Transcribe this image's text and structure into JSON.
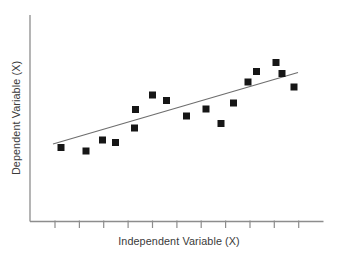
{
  "chart_data": {
    "type": "scatter",
    "title": "",
    "xlabel": "Independent Variable (X)",
    "ylabel": "Dependent Variable (X)",
    "legend": false,
    "grid": false,
    "coords": "screen pixels on 337x258 canvas, y increases downward",
    "plot_area": {
      "y_axis_x": 30,
      "y_axis_top": 15,
      "x_axis_y": 221.5,
      "x_axis_end": 323.5
    },
    "x_ticks": {
      "labels_shown": false,
      "tick_length": 6.5,
      "positions": [
        55,
        79.4,
        103.7,
        128.1,
        152.5,
        176.9,
        201.2,
        225.6,
        250.0,
        274.3,
        298.7
      ]
    },
    "y_ticks": {
      "labels_shown": false,
      "positions": []
    },
    "marker": {
      "shape": "square",
      "size": 7,
      "color": "#161616"
    },
    "trend_line": {
      "x1": 53,
      "y1": 144,
      "x2": 298,
      "y2": 72.5,
      "color": "#6e6e6e",
      "width": 1.2
    },
    "points": [
      [
        61,
        147.5
      ],
      [
        86,
        151
      ],
      [
        102.5,
        140
      ],
      [
        115.5,
        142.5
      ],
      [
        134.5,
        128
      ],
      [
        135.5,
        109.5
      ],
      [
        152.5,
        95
      ],
      [
        166.5,
        100.5
      ],
      [
        186.5,
        116
      ],
      [
        206,
        109
      ],
      [
        221,
        123.5
      ],
      [
        233.5,
        103
      ],
      [
        248,
        82
      ],
      [
        256.5,
        71.5
      ],
      [
        276,
        62.5
      ],
      [
        282,
        73.5
      ],
      [
        294,
        87
      ]
    ],
    "axis_color": "#8d8d8d",
    "axis_width": 1.3,
    "label_color": "#3a3a3a"
  }
}
